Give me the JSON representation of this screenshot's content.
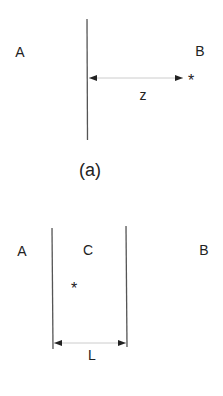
{
  "panel_a": {
    "caption": "(a)",
    "region_left": "A",
    "region_right": "B",
    "distance_label": "z",
    "source_marker": "*"
  },
  "panel_b": {
    "region_left": "A",
    "region_middle": "C",
    "region_right": "B",
    "width_label": "L",
    "source_marker": "*"
  },
  "colors": {
    "line": "#444444",
    "arrow": "#bbbbbb",
    "text": "#222222"
  }
}
